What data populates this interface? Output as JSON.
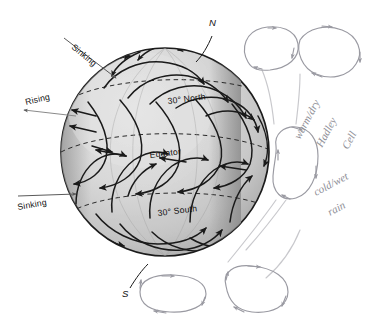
{
  "figure": {
    "background_color": "#ffffff",
    "globe": {
      "fill_light": "#dcdcdc",
      "fill_mid": "#cfcfcf",
      "fill_shadow": "#a9a9a9",
      "outline_color": "#1c1c1c",
      "center_x": 165,
      "center_y": 152,
      "radius": 104
    },
    "ink_color": "#1a1a1a",
    "pencil_color": "#8e8e96"
  },
  "latitude_lines": [
    {
      "label": "30° North",
      "label_x": 168,
      "label_y": 104,
      "rotation": -7
    },
    {
      "label": "Equator",
      "label_x": 150,
      "label_y": 158,
      "rotation": -7
    },
    {
      "label": "30° South",
      "label_x": 158,
      "label_y": 216,
      "rotation": -7
    }
  ],
  "pole_labels": [
    {
      "name": "north-pole-label",
      "text": "N",
      "x": 209,
      "y": 26
    },
    {
      "name": "south-pole-label",
      "text": "S",
      "x": 126,
      "y": 295
    }
  ],
  "callouts": [
    {
      "name": "sinking-north",
      "text": "Sinking",
      "x": 71,
      "y": 48,
      "rotation": -40
    },
    {
      "name": "rising-equator",
      "text": "Rising",
      "x": 26,
      "y": 105,
      "rotation": -13
    },
    {
      "name": "sinking-south",
      "text": "Sinking",
      "x": 18,
      "y": 208,
      "rotation": -10
    }
  ],
  "annotations": [
    {
      "name": "annotation-warm-dry",
      "text": "warm/dry",
      "x": 300,
      "y": 140,
      "rotation": -62
    },
    {
      "name": "annotation-hadley",
      "text": "Hadley",
      "x": 322,
      "y": 148,
      "rotation": -62
    },
    {
      "name": "annotation-cell",
      "text": "Cell",
      "x": 345,
      "y": 152,
      "rotation": -62
    },
    {
      "name": "annotation-cold-wet",
      "text": "cold/wet",
      "x": 318,
      "y": 196,
      "rotation": -28
    },
    {
      "name": "annotation-rain",
      "text": "rain",
      "x": 332,
      "y": 216,
      "rotation": -28
    }
  ],
  "circulation_cells": [
    {
      "name": "cell-loop-north-polar",
      "cx": 268,
      "cy": 48,
      "rx": 26,
      "ry": 19,
      "rotation": -22
    },
    {
      "name": "cell-loop-north-ferrel",
      "cx": 320,
      "cy": 62,
      "rx": 28,
      "ry": 20,
      "rotation": -16
    },
    {
      "name": "cell-loop-north-hadley",
      "cx": 295,
      "cy": 172,
      "rx": 21,
      "ry": 32,
      "rotation": 4
    },
    {
      "name": "cell-loop-south-hadley",
      "cx": 252,
      "cy": 292,
      "rx": 32,
      "ry": 20,
      "rotation": 12
    },
    {
      "name": "cell-loop-south-ferrel",
      "cx": 172,
      "cy": 296,
      "rx": 33,
      "ry": 18,
      "rotation": 2
    }
  ],
  "wind_bands": [
    {
      "name": "polar-easterlies-north",
      "arrow_count": 5
    },
    {
      "name": "westerlies-north",
      "arrow_count": 6
    },
    {
      "name": "trade-winds-north",
      "arrow_count": 6
    },
    {
      "name": "trade-winds-south",
      "arrow_count": 6
    },
    {
      "name": "westerlies-south",
      "arrow_count": 6
    },
    {
      "name": "polar-easterlies-south",
      "arrow_count": 5
    }
  ]
}
